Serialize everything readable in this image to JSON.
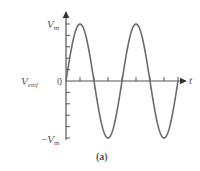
{
  "chart_data": {
    "type": "line",
    "title": "",
    "caption": "(a)",
    "xlabel": "t",
    "ylabel": "V_emf",
    "ylabel_main": "V",
    "ylabel_sub": "emf",
    "y_ticks_labels": {
      "top": {
        "main": "V",
        "sub": "m"
      },
      "zero": "0",
      "bottom": {
        "prefix": "−",
        "main": "V",
        "sub": "m"
      }
    },
    "ylim": [
      -1,
      1
    ],
    "xlim": [
      0,
      2.1
    ],
    "x_unit": "periods",
    "series": [
      {
        "name": "V_emf(t) = V_m sin(ωt)",
        "function": "sine",
        "amplitude": 1,
        "periods_shown": 2,
        "x": [
          0,
          0.25,
          0.5,
          0.75,
          1.0,
          1.25,
          1.5,
          1.75,
          2.0
        ],
        "values": [
          0,
          1,
          0,
          -1,
          0,
          1,
          0,
          -1,
          0
        ]
      }
    ],
    "y_minor_ticks_per_half": 5,
    "x_ticks_at": [
      0.25,
      0.5,
      0.75,
      1.0,
      1.25,
      1.5,
      1.75,
      2.0
    ],
    "grid": false,
    "legend": null,
    "colors": {
      "curve": "#6b6b6b",
      "axes": "#555555",
      "text": "#555555"
    }
  }
}
